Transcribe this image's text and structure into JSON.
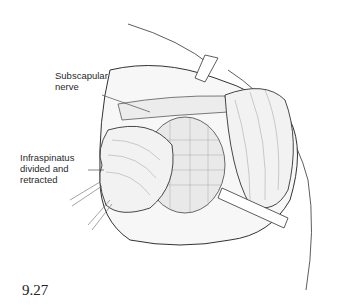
{
  "figure": {
    "number": "9.27",
    "labels": [
      {
        "id": "subscapular-nerve",
        "lines": [
          "Subscapular",
          "nerve"
        ]
      },
      {
        "id": "infraspinatus",
        "lines": [
          "Infraspinatus",
          "divided and",
          "retracted"
        ]
      }
    ]
  }
}
